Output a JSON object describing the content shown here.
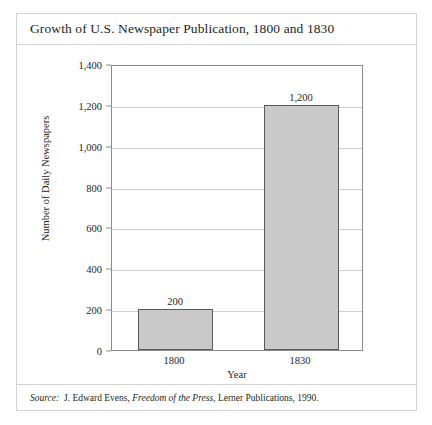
{
  "figure": {
    "title": "Growth of U.S. Newspaper Publication, 1800 and 1830",
    "source_prefix": "Source:",
    "source_author": "J. Edward Evens,",
    "source_work": "Freedom of the Press",
    "source_rest": ", Lerner Publications, 1990."
  },
  "chart_data": {
    "type": "bar",
    "title": "Growth of U.S. Newspaper Publication, 1800 and 1830",
    "categories": [
      "1800",
      "1830"
    ],
    "values": [
      200,
      1200
    ],
    "data_labels": [
      "200",
      "1,200"
    ],
    "xlabel": "Year",
    "ylabel": "Number of Daily Newspapers",
    "ylim": [
      0,
      1400
    ],
    "ytick_step": 200,
    "ytick_labels": [
      "0",
      "200",
      "400",
      "600",
      "800",
      "1,000",
      "1,200",
      "1,400"
    ],
    "ytick_values": [
      0,
      200,
      400,
      600,
      800,
      1000,
      1200,
      1400
    ],
    "grid": "horizontal",
    "legend": "none",
    "bar_fill_color": "#c9c9c9",
    "bar_edge_color": "#5a5a5a",
    "gridline_color": "#cfcfcf",
    "axis_color": "#8a8a8a"
  }
}
